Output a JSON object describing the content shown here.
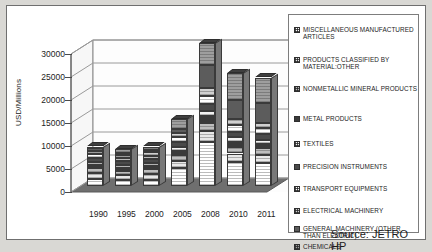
{
  "axis": {
    "ylabel": "USD/Millions",
    "yticks": [
      "30000",
      "25000",
      "20000",
      "15000",
      "10000",
      "5000",
      "0"
    ]
  },
  "source_note": "Source: JETRO HP",
  "legend": {
    "items": [
      {
        "label": "MISCELLANEOUS MANUFACTURED ARTICLES",
        "color": "#ffffff",
        "pattern": "grid"
      },
      {
        "label": "PRODUCTS CLASSIFIED BY MATERIAL:OTHER",
        "color": "#e8e8e8",
        "pattern": "grid"
      },
      {
        "label": "NONMETALLIC MINERAL PRODUCTS",
        "color": "#bdbdbd",
        "pattern": "grid"
      },
      {
        "label": "METAL PRODUCTS",
        "color": "#3a3a3a",
        "pattern": "solid"
      },
      {
        "label": "TEXTILES",
        "color": "#f2f2f2",
        "pattern": "grid"
      },
      {
        "label": "PRECISION INSTRUMENTS",
        "color": "#4a4a4a",
        "pattern": "solid"
      },
      {
        "label": "TRANSPORT EQUIPMENTS",
        "color": "#ffffff",
        "pattern": "grid"
      },
      {
        "label": "ELECTRICAL MACHINERY",
        "color": "#d0d0d0",
        "pattern": "grid"
      },
      {
        "label": "GENERAL MACHINERY (OTHER THAN ELECTRIC)",
        "color": "#5c5c5c",
        "pattern": "solid"
      },
      {
        "label": "CHEMICALS",
        "color": "#9e9e9e",
        "pattern": "grid"
      }
    ]
  },
  "chart_data": {
    "type": "bar",
    "title": "",
    "xlabel": "",
    "ylabel": "USD/Millions",
    "ylim": [
      0,
      30000
    ],
    "yticks": [
      0,
      5000,
      10000,
      15000,
      20000,
      25000,
      30000
    ],
    "grid": true,
    "legend_position": "right",
    "stacked": true,
    "three_d": true,
    "categories": [
      "1990",
      "1995",
      "2000",
      "2005",
      "2008",
      "2010",
      "2011"
    ],
    "series": [
      {
        "name": "CHEMICALS",
        "values": [
          1500,
          1200,
          1300,
          3900,
          9500,
          5200,
          5000
        ]
      },
      {
        "name": "GENERAL MACHINERY (OTHER THAN ELECTRIC)",
        "values": [
          1300,
          1100,
          1200,
          1500,
          2300,
          1800,
          1700
        ]
      },
      {
        "name": "ELECTRICAL MACHINERY",
        "values": [
          1100,
          1000,
          1100,
          1300,
          1900,
          1500,
          1400
        ]
      },
      {
        "name": "TRANSPORT EQUIPMENTS",
        "values": [
          700,
          650,
          700,
          900,
          1400,
          1100,
          1000
        ]
      },
      {
        "name": "PRECISION INSTRUMENTS",
        "values": [
          600,
          550,
          600,
          800,
          1200,
          950,
          900
        ]
      },
      {
        "name": "TEXTILES",
        "values": [
          900,
          800,
          850,
          1000,
          1500,
          1200,
          1150
        ]
      },
      {
        "name": "METAL PRODUCTS",
        "values": [
          800,
          750,
          800,
          1100,
          1800,
          1400,
          1350
        ]
      },
      {
        "name": "NONMETALLIC MINERAL PRODUCTS",
        "values": [
          700,
          650,
          700,
          950,
          1600,
          1250,
          1200
        ]
      },
      {
        "name": "PRODUCTS CLASSIFIED BY MATERIAL:OTHER",
        "values": [
          500,
          500,
          600,
          900,
          5100,
          4300,
          4200
        ]
      },
      {
        "name": "MISCELLANEOUS MANUFACTURED ARTICLES",
        "values": [
          400,
          800,
          650,
          2150,
          4700,
          5800,
          5600
        ]
      }
    ],
    "totals": [
      8500,
      8000,
      8500,
      14500,
      31000,
      23500,
      23000
    ]
  }
}
